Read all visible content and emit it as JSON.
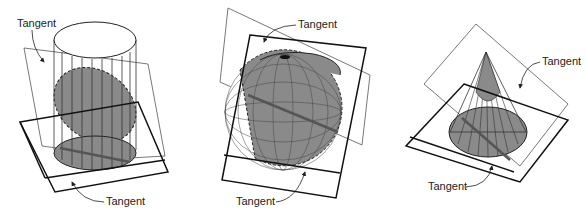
{
  "figures": [
    {
      "name": "cylinder",
      "labels": [
        "Tangent",
        "Tangent"
      ]
    },
    {
      "name": "sphere",
      "labels": [
        "Tangent",
        "Tangent"
      ]
    },
    {
      "name": "cone",
      "labels": [
        "Tangent",
        "Tangent"
      ]
    }
  ],
  "colors": {
    "fill": "#8a8a8a",
    "line": "#1a1a1a",
    "plane_thin": "#555555"
  }
}
